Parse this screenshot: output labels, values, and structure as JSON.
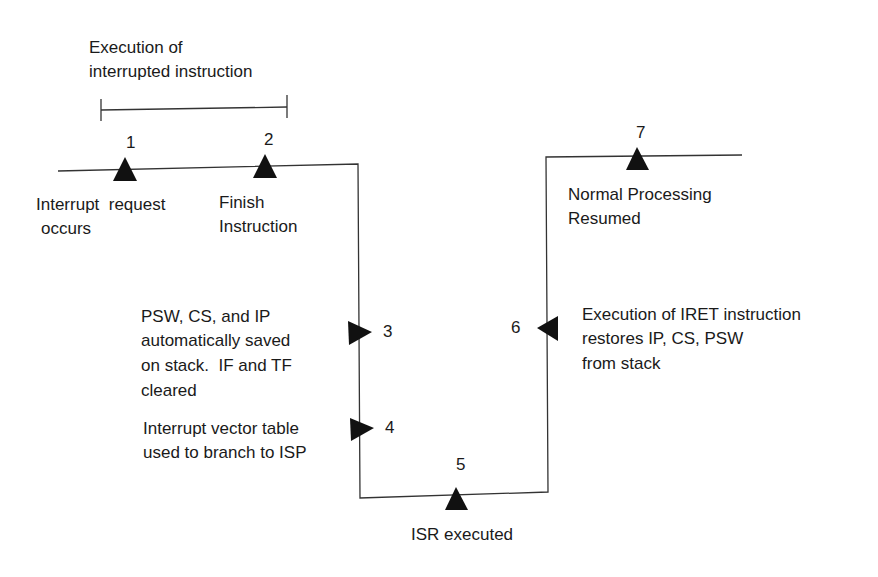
{
  "diagram": {
    "type": "interrupt-processing-timeline",
    "span_label": {
      "line1": "Execution of",
      "line2": "interrupted instruction"
    },
    "steps": [
      {
        "number": "1",
        "label_line1": "Interrupt  request",
        "label_line2": "occurs",
        "marker": "up-triangle"
      },
      {
        "number": "2",
        "label_line1": "Finish",
        "label_line2": "Instruction",
        "marker": "up-triangle"
      },
      {
        "number": "3",
        "label_line1": "PSW, CS, and IP",
        "label_line2": "automatically saved",
        "label_line3": "on stack.  IF and TF",
        "label_line4": "cleared",
        "marker": "right-triangle"
      },
      {
        "number": "4",
        "label_line1": "Interrupt vector table",
        "label_line2": "used to branch to ISP",
        "marker": "right-triangle"
      },
      {
        "number": "5",
        "label_line1": "ISR executed",
        "marker": "up-triangle"
      },
      {
        "number": "6",
        "label_line1": "Execution of IRET instruction",
        "label_line2": "restores IP, CS, PSW",
        "label_line3": "from stack",
        "marker": "left-triangle"
      },
      {
        "number": "7",
        "label_line1": "Normal Processing",
        "label_line2": "Resumed",
        "marker": "up-triangle"
      }
    ],
    "colors": {
      "line": "#333333",
      "marker": "#111111",
      "text": "#1a1a1a",
      "background": "#ffffff"
    }
  }
}
